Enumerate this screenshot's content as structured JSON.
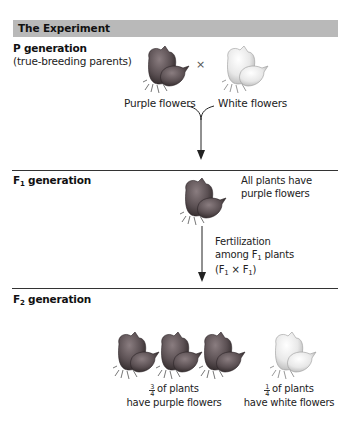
{
  "header": {
    "title": "The Experiment"
  },
  "colors": {
    "header_bar": "#b9b9b9",
    "purple_flower": "#5a4f52",
    "white_flower": "#e6e6e6",
    "divider": "#333333"
  },
  "p_generation": {
    "label": "P generation",
    "sublabel": "(true-breeding parents)",
    "cross_symbol": "×",
    "parents": [
      {
        "label": "Purple flowers",
        "color": "purple"
      },
      {
        "label": "White flowers",
        "color": "white"
      }
    ]
  },
  "f1_generation": {
    "label_prefix": "F",
    "label_sub": "1",
    "label_suffix": " generation",
    "note_line1": "All plants have",
    "note_line2": "purple flowers",
    "fertilization": {
      "line1": "Fertilization",
      "line2_prefix": "among F",
      "line2_sub": "1",
      "line2_suffix": " plants",
      "line3_open": "(F",
      "line3_sub1": "1",
      "line3_cross": " × F",
      "line3_sub2": "1",
      "line3_close": ")"
    }
  },
  "f2_generation": {
    "label_prefix": "F",
    "label_sub": "2",
    "label_suffix": " generation",
    "groups": [
      {
        "fraction_num": "3",
        "fraction_den": "4",
        "line1": "of plants",
        "line2": "have purple flowers",
        "count": 3,
        "color": "purple"
      },
      {
        "fraction_num": "1",
        "fraction_den": "4",
        "line1": "of plants",
        "line2": "have white flowers",
        "count": 1,
        "color": "white"
      }
    ]
  }
}
